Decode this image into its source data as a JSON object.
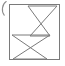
{
  "figure": {
    "background_color": "#ffffff",
    "stroke_color": "#7a7a7a",
    "frame": {
      "name": "rectangular-border",
      "x": 9,
      "y": 4,
      "width": 51,
      "height": 56,
      "stroke_width": 1
    },
    "shapes": [
      {
        "name": "upper-bowtie",
        "type": "bowtie",
        "points": "28,6 57,6 30,36 50,36",
        "crossing_point": [
          43,
          21
        ],
        "top_edge": {
          "x1": 28,
          "y1": 6,
          "x2": 57,
          "y2": 6
        },
        "bottom_edge": {
          "x1": 30,
          "y1": 36,
          "x2": 50,
          "y2": 36
        }
      },
      {
        "name": "lower-bowtie",
        "type": "bowtie",
        "points": "12,35 50,35 13,59 47,59",
        "crossing_point": [
          30,
          47
        ],
        "top_edge": {
          "x1": 12,
          "y1": 35,
          "x2": 50,
          "y2": 35
        },
        "bottom_edge": {
          "x1": 13,
          "y1": 59,
          "x2": 47,
          "y2": 59
        }
      }
    ],
    "clipped_glyph": {
      "name": "clipped-arc-glyph",
      "description": "partial curved mark cut off at the left edge of the crop",
      "color": "#8d8d8d"
    }
  }
}
